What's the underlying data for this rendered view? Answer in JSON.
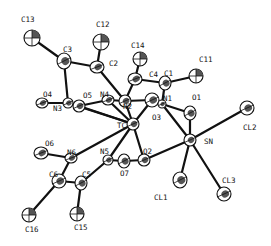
{
  "diagram": {
    "type": "ORTEP molecular structure",
    "atoms": [
      {
        "id": "C13",
        "label": "C13",
        "x": 32,
        "y": 38,
        "rx": 8,
        "ry": 8,
        "kind": "methyl",
        "lx": 21,
        "ly": 22
      },
      {
        "id": "C12",
        "label": "C12",
        "x": 101,
        "y": 42,
        "rx": 8,
        "ry": 8,
        "kind": "methyl",
        "lx": 96,
        "ly": 27
      },
      {
        "id": "C14",
        "label": "C14",
        "x": 140,
        "y": 59,
        "rx": 7,
        "ry": 7,
        "kind": "methyl",
        "lx": 131,
        "ly": 48
      },
      {
        "id": "C11",
        "label": "C11",
        "x": 196,
        "y": 76,
        "rx": 7,
        "ry": 7,
        "kind": "methyl",
        "lx": 199,
        "ly": 62
      },
      {
        "id": "C3",
        "label": "C3",
        "x": 64,
        "y": 61,
        "rx": 7,
        "ry": 8,
        "kind": "carbon",
        "lx": 63,
        "ly": 52
      },
      {
        "id": "C2",
        "label": "C2",
        "x": 97,
        "y": 67,
        "rx": 7,
        "ry": 6,
        "kind": "carbon",
        "lx": 109,
        "ly": 66
      },
      {
        "id": "C4",
        "label": "C4",
        "x": 135,
        "y": 79,
        "rx": 7,
        "ry": 6,
        "kind": "carbon",
        "lx": 149,
        "ly": 77
      },
      {
        "id": "C1",
        "label": "C1",
        "x": 165,
        "y": 83,
        "rx": 6,
        "ry": 7,
        "kind": "carbon",
        "lx": 164,
        "ly": 76
      },
      {
        "id": "O4",
        "label": "O4",
        "x": 42,
        "y": 103,
        "rx": 6,
        "ry": 5,
        "kind": "oxygen",
        "lx": 43,
        "ly": 97
      },
      {
        "id": "N3",
        "label": "N3",
        "x": 68,
        "y": 103,
        "rx": 5,
        "ry": 5,
        "kind": "nitrogen",
        "lx": 53,
        "ly": 111
      },
      {
        "id": "O5",
        "label": "O5",
        "x": 79,
        "y": 106,
        "rx": 6,
        "ry": 6,
        "kind": "oxygen",
        "lx": 83,
        "ly": 98
      },
      {
        "id": "N4",
        "label": "N4",
        "x": 108,
        "y": 100,
        "rx": 6,
        "ry": 5,
        "kind": "nitrogen",
        "lx": 100,
        "ly": 97
      },
      {
        "id": "N2",
        "label": "N2",
        "x": 125,
        "y": 101,
        "rx": 6,
        "ry": 6,
        "kind": "nitrogen",
        "lx": 123,
        "ly": 109
      },
      {
        "id": "O3",
        "label": "O3",
        "x": 152,
        "y": 100,
        "rx": 7,
        "ry": 7,
        "kind": "oxygen",
        "lx": 152,
        "ly": 120
      },
      {
        "id": "N1",
        "label": "N1",
        "x": 162,
        "y": 104,
        "rx": 4,
        "ry": 4,
        "kind": "nitrogen",
        "lx": 163,
        "ly": 101
      },
      {
        "id": "O1",
        "label": "O1",
        "x": 190,
        "y": 113,
        "rx": 6,
        "ry": 7,
        "kind": "oxygen",
        "lx": 192,
        "ly": 100
      },
      {
        "id": "TC",
        "label": "TC",
        "x": 133,
        "y": 124,
        "rx": 6,
        "ry": 6,
        "kind": "metal",
        "lx": 117,
        "ly": 128
      },
      {
        "id": "SN",
        "label": "SN",
        "x": 190,
        "y": 140,
        "rx": 6,
        "ry": 6,
        "kind": "metal",
        "lx": 204,
        "ly": 144
      },
      {
        "id": "CL2",
        "label": "CL2",
        "x": 247,
        "y": 108,
        "rx": 7,
        "ry": 7,
        "kind": "chlorine",
        "lx": 243,
        "ly": 130
      },
      {
        "id": "N6",
        "label": "N6",
        "x": 71,
        "y": 158,
        "rx": 6,
        "ry": 5,
        "kind": "nitrogen",
        "lx": 67,
        "ly": 155
      },
      {
        "id": "O6",
        "label": "O6",
        "x": 41,
        "y": 153,
        "rx": 7,
        "ry": 6,
        "kind": "oxygen",
        "lx": 45,
        "ly": 146
      },
      {
        "id": "N5",
        "label": "N5",
        "x": 108,
        "y": 160,
        "rx": 5,
        "ry": 5,
        "kind": "nitrogen",
        "lx": 100,
        "ly": 154
      },
      {
        "id": "O7",
        "label": "O7",
        "x": 124,
        "y": 161,
        "rx": 6,
        "ry": 7,
        "kind": "oxygen",
        "lx": 120,
        "ly": 176
      },
      {
        "id": "O2",
        "label": "O2",
        "x": 144,
        "y": 160,
        "rx": 6,
        "ry": 6,
        "kind": "oxygen",
        "lx": 143,
        "ly": 154
      },
      {
        "id": "C6",
        "label": "C6",
        "x": 59,
        "y": 181,
        "rx": 7,
        "ry": 7,
        "kind": "carbon",
        "lx": 49,
        "ly": 177
      },
      {
        "id": "C5",
        "label": "C5",
        "x": 81,
        "y": 183,
        "rx": 6,
        "ry": 7,
        "kind": "carbon",
        "lx": 82,
        "ly": 177
      },
      {
        "id": "C16",
        "label": "C16",
        "x": 29,
        "y": 215,
        "rx": 7,
        "ry": 7,
        "kind": "methyl",
        "lx": 25,
        "ly": 232
      },
      {
        "id": "C15",
        "label": "C15",
        "x": 77,
        "y": 214,
        "rx": 7,
        "ry": 7,
        "kind": "methyl",
        "lx": 74,
        "ly": 230
      },
      {
        "id": "CL1",
        "label": "CL1",
        "x": 180,
        "y": 180,
        "rx": 7,
        "ry": 8,
        "kind": "chlorine",
        "lx": 154,
        "ly": 200
      },
      {
        "id": "CL3",
        "label": "CL3",
        "x": 224,
        "y": 194,
        "rx": 7,
        "ry": 7,
        "kind": "chlorine",
        "lx": 222,
        "ly": 183
      }
    ],
    "bonds": [
      [
        "C13",
        "C3"
      ],
      [
        "C3",
        "C2"
      ],
      [
        "C3",
        "N3"
      ],
      [
        "C2",
        "C12"
      ],
      [
        "C2",
        "N2"
      ],
      [
        "O4",
        "N3"
      ],
      [
        "N3",
        "O5"
      ],
      [
        "O5",
        "N4"
      ],
      [
        "N4",
        "N2"
      ],
      [
        "N4",
        "TC"
      ],
      [
        "N2",
        "C4"
      ],
      [
        "N2",
        "TC"
      ],
      [
        "C4",
        "C14"
      ],
      [
        "C4",
        "C1"
      ],
      [
        "C1",
        "C11"
      ],
      [
        "C1",
        "N1"
      ],
      [
        "N1",
        "O1"
      ],
      [
        "N1",
        "O3"
      ],
      [
        "N1",
        "SN"
      ],
      [
        "O3",
        "TC"
      ],
      [
        "O3",
        "N2"
      ],
      [
        "O5",
        "TC"
      ],
      [
        "N3",
        "TC"
      ],
      [
        "TC",
        "N6"
      ],
      [
        "TC",
        "N5"
      ],
      [
        "TC",
        "O2"
      ],
      [
        "O1",
        "SN"
      ],
      [
        "SN",
        "CL2"
      ],
      [
        "SN",
        "CL1"
      ],
      [
        "SN",
        "CL3"
      ],
      [
        "SN",
        "O2"
      ],
      [
        "N6",
        "O6"
      ],
      [
        "N6",
        "C6"
      ],
      [
        "C6",
        "C5"
      ],
      [
        "C6",
        "C16"
      ],
      [
        "C5",
        "C15"
      ],
      [
        "C5",
        "N5"
      ],
      [
        "N5",
        "O7"
      ],
      [
        "O7",
        "O2"
      ]
    ]
  }
}
